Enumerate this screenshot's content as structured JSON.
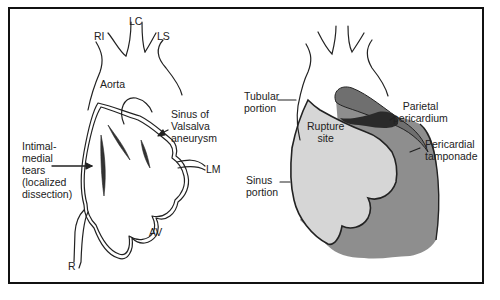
{
  "figure": {
    "panels": [
      {
        "id": "left",
        "title": "Sinus of Valsalva aneurysm with localized dissection",
        "labels": {
          "ri": "RI",
          "lc": "LC",
          "ls": "LS",
          "aorta": "Aorta",
          "sinus_line1": "Sinus of",
          "sinus_line2": "Valsalva",
          "sinus_line3": "aneurysm",
          "tears_line1": "Intimal-",
          "tears_line2": "medial",
          "tears_line3": "tears",
          "tears_line4": "(localized",
          "tears_line5": "dissection)",
          "lm": "LM",
          "av": "AV",
          "r": "R"
        }
      },
      {
        "id": "right",
        "title": "Rupture with pericardial tamponade",
        "labels": {
          "tubular_line1": "Tubular",
          "tubular_line2": "portion",
          "rupture_line1": "Rupture",
          "rupture_line2": "site",
          "parietal_line1": "Parietal",
          "parietal_line2": "pericardium",
          "pericardial_line1": "Pericardial",
          "pericardial_line2": "tamponade",
          "sinus_line1": "Sinus",
          "sinus_line2": "portion"
        }
      }
    ],
    "colors": {
      "line": "#222222",
      "frame": "#111111",
      "aneurysm_fill": "#d6d6d6",
      "tamponade_fill": "#8e8e8e",
      "rupture_fill": "#2a2a2a",
      "background": "#ffffff"
    }
  }
}
